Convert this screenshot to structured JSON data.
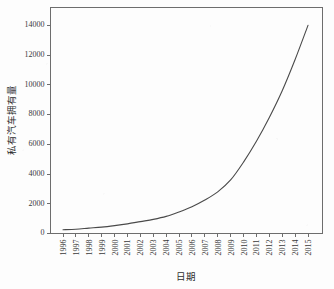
{
  "chart_data": {
    "type": "line",
    "title": "",
    "xlabel": "日期",
    "ylabel": "私有汽车拥有量",
    "x": [
      "1996",
      "1997",
      "1998",
      "1999",
      "2000",
      "2001",
      "2002",
      "2003",
      "2004",
      "2005",
      "2006",
      "2007",
      "2008",
      "2009",
      "2010",
      "2011",
      "2012",
      "2013",
      "2014",
      "2015"
    ],
    "values": [
      250,
      290,
      360,
      430,
      530,
      650,
      800,
      950,
      1150,
      1450,
      1800,
      2250,
      2800,
      3600,
      4800,
      6200,
      7800,
      9600,
      11700,
      14000
    ],
    "series": [
      {
        "name": "私有汽车拥有量",
        "values": [
          250,
          290,
          360,
          430,
          530,
          650,
          800,
          950,
          1150,
          1450,
          1800,
          2250,
          2800,
          3600,
          4800,
          6200,
          7800,
          9600,
          11700,
          14000
        ],
        "color": "#4a4a4a"
      }
    ],
    "ytick_labels": [
      "0",
      "2000",
      "4000",
      "6000",
      "8000",
      "10000",
      "12000",
      "14000"
    ],
    "ytick_values": [
      0,
      2000,
      4000,
      6000,
      8000,
      10000,
      12000,
      14000
    ],
    "ylim": [
      0,
      15200
    ],
    "xlim": [
      "1996",
      "2015"
    ],
    "grid": false,
    "legend": false,
    "legend_position": "none",
    "axis_color": "#6d6d6d",
    "line_color": "#4a4a4a",
    "background_color": "#fdfdfd",
    "frame": true,
    "xtick_rotation": 90
  }
}
